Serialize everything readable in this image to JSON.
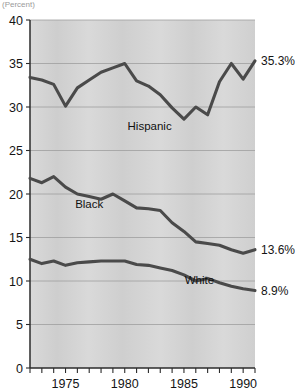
{
  "figure": {
    "clipped_header": "(Percent)",
    "background_color": "#d2d2d2",
    "line_color": "#4a4a4a"
  },
  "chart_data": {
    "type": "line",
    "title": "",
    "subtitle": "",
    "xlabel": "",
    "ylabel": "",
    "xlim": [
      1972,
      1991
    ],
    "ylim": [
      0,
      40
    ],
    "grid": true,
    "legend_position": "inline-labels",
    "yticks": [
      0,
      5,
      10,
      15,
      20,
      25,
      30,
      35,
      40
    ],
    "ytick_labels": [
      "0",
      "5",
      "10",
      "15",
      "20",
      "25",
      "30",
      "35",
      "40"
    ],
    "xticks": [
      1972,
      1973,
      1974,
      1975,
      1976,
      1977,
      1978,
      1979,
      1980,
      1981,
      1982,
      1983,
      1984,
      1985,
      1986,
      1987,
      1988,
      1989,
      1990,
      1991
    ],
    "xtick_labels_shown": [
      "1975",
      "1980",
      "1985",
      "1990"
    ],
    "xtick_label_values": [
      1975,
      1980,
      1985,
      1990
    ],
    "x": [
      1972,
      1973,
      1974,
      1975,
      1976,
      1977,
      1978,
      1979,
      1980,
      1981,
      1982,
      1983,
      1984,
      1985,
      1986,
      1987,
      1988,
      1989,
      1990,
      1991
    ],
    "series": [
      {
        "name": "Hispanic",
        "label": "Hispanic",
        "end_label": "35.3%",
        "end_value": 35.3,
        "label_x": 1982.1,
        "label_y": 27.4,
        "values": [
          33.4,
          33.1,
          32.6,
          30.1,
          32.2,
          33.1,
          34.0,
          34.5,
          35.0,
          33.0,
          32.4,
          31.4,
          29.9,
          28.6,
          30.0,
          29.1,
          32.9,
          35.0,
          33.2,
          35.3
        ]
      },
      {
        "name": "Black",
        "label": "Black",
        "end_label": "13.6%",
        "end_value": 13.6,
        "label_x": 1977.0,
        "label_y": 18.4,
        "values": [
          21.8,
          21.3,
          22.0,
          20.8,
          20.0,
          19.7,
          19.4,
          20.0,
          19.2,
          18.4,
          18.3,
          18.1,
          16.7,
          15.7,
          14.5,
          14.3,
          14.1,
          13.6,
          13.2,
          13.6
        ]
      },
      {
        "name": "White",
        "label": "White",
        "end_label": "8.9%",
        "end_value": 8.9,
        "label_x": 1986.3,
        "label_y": 9.6,
        "values": [
          12.5,
          12.0,
          12.3,
          11.8,
          12.1,
          12.2,
          12.3,
          12.3,
          12.3,
          11.9,
          11.8,
          11.5,
          11.2,
          10.7,
          10.0,
          10.3,
          9.8,
          9.4,
          9.1,
          8.9
        ]
      }
    ]
  }
}
